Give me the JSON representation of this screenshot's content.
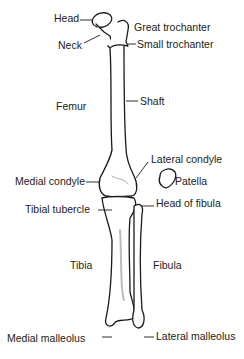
{
  "diagram": {
    "labels": {
      "head": "Head",
      "neck": "Neck",
      "great_trochanter": "Great trochanter",
      "small_trochanter": "Small trochanter",
      "femur": "Femur",
      "shaft": "Shaft",
      "lateral_condyle": "Lateral condyle",
      "medial_condyle": "Medial condyle",
      "patella": "Patella",
      "tibial_tubercle": "Tibial tubercle",
      "head_of_fibula": "Head of fibula",
      "tibia": "Tibia",
      "fibula": "Fibula",
      "medial_malleolus": "Medial malleolus",
      "lateral_malleolus": "Lateral malleolus"
    },
    "colors": {
      "line": "#1a1a1a",
      "bone_fill": "#ffffff",
      "shade": "#bbbbbb"
    }
  }
}
